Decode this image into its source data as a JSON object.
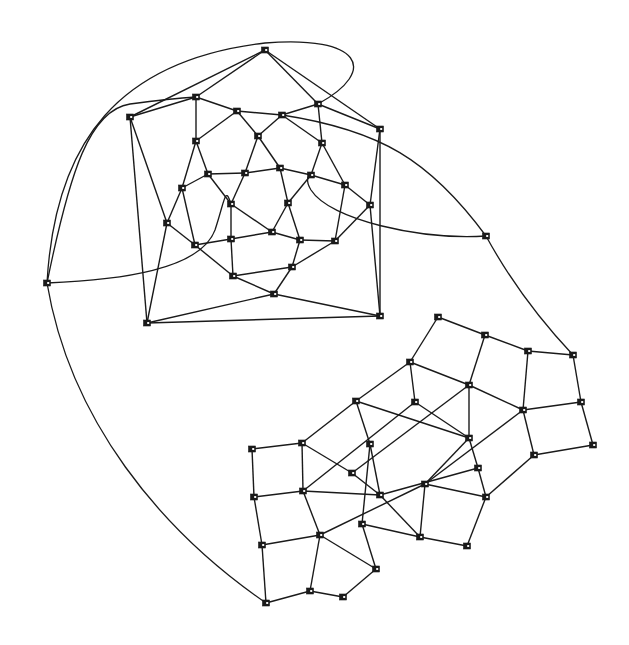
{
  "diagram": {
    "title": "",
    "colors": {
      "background": "#ffffff",
      "edge": "#1a1a1a",
      "node": "#1a1a1a"
    },
    "node_size": 7,
    "components": [
      {
        "name": "upper-component",
        "nodes": {
          "a": [
            265,
            50
          ],
          "b": [
            130,
            117
          ],
          "c": [
            196,
            97
          ],
          "d": [
            237,
            111
          ],
          "e": [
            282,
            115
          ],
          "f": [
            318,
            104
          ],
          "g": [
            380,
            129
          ],
          "h": [
            196,
            141
          ],
          "i": [
            258,
            136
          ],
          "j": [
            322,
            143
          ],
          "k": [
            208,
            174
          ],
          "l": [
            245,
            173
          ],
          "m": [
            280,
            168
          ],
          "n": [
            311,
            175
          ],
          "o": [
            345,
            185
          ],
          "p": [
            182,
            188
          ],
          "q": [
            231,
            204
          ],
          "r": [
            288,
            203
          ],
          "s": [
            370,
            205
          ],
          "t": [
            167,
            223
          ],
          "u": [
            195,
            245
          ],
          "v": [
            231,
            239
          ],
          "w": [
            272,
            232
          ],
          "x": [
            300,
            240
          ],
          "y": [
            335,
            241
          ],
          "z": [
            233,
            276
          ],
          "aa": [
            292,
            267
          ],
          "ab": [
            274,
            294
          ],
          "ac": [
            147,
            323
          ],
          "ad": [
            380,
            316
          ]
        },
        "edges": [
          [
            "a",
            "b"
          ],
          [
            "a",
            "c"
          ],
          [
            "a",
            "f"
          ],
          [
            "a",
            "g"
          ],
          [
            "b",
            "c"
          ],
          [
            "b",
            "t"
          ],
          [
            "b",
            "ac"
          ],
          [
            "c",
            "d"
          ],
          [
            "c",
            "h"
          ],
          [
            "d",
            "e"
          ],
          [
            "d",
            "h"
          ],
          [
            "d",
            "i"
          ],
          [
            "e",
            "f"
          ],
          [
            "e",
            "i"
          ],
          [
            "e",
            "j"
          ],
          [
            "f",
            "g"
          ],
          [
            "f",
            "j"
          ],
          [
            "g",
            "ad"
          ],
          [
            "g",
            "s"
          ],
          [
            "h",
            "p"
          ],
          [
            "h",
            "k"
          ],
          [
            "i",
            "l"
          ],
          [
            "i",
            "m"
          ],
          [
            "j",
            "n"
          ],
          [
            "j",
            "o"
          ],
          [
            "k",
            "l"
          ],
          [
            "k",
            "p"
          ],
          [
            "k",
            "q"
          ],
          [
            "l",
            "m"
          ],
          [
            "l",
            "q"
          ],
          [
            "m",
            "n"
          ],
          [
            "m",
            "r"
          ],
          [
            "n",
            "o"
          ],
          [
            "n",
            "r"
          ],
          [
            "o",
            "s"
          ],
          [
            "o",
            "y"
          ],
          [
            "p",
            "t"
          ],
          [
            "p",
            "u"
          ],
          [
            "q",
            "v"
          ],
          [
            "q",
            "w"
          ],
          [
            "r",
            "w"
          ],
          [
            "r",
            "x"
          ],
          [
            "s",
            "y"
          ],
          [
            "s",
            "ad"
          ],
          [
            "t",
            "u"
          ],
          [
            "t",
            "ac"
          ],
          [
            "u",
            "v"
          ],
          [
            "u",
            "z"
          ],
          [
            "v",
            "w"
          ],
          [
            "v",
            "z"
          ],
          [
            "w",
            "x"
          ],
          [
            "x",
            "y"
          ],
          [
            "x",
            "aa"
          ],
          [
            "y",
            "aa"
          ],
          [
            "z",
            "aa"
          ],
          [
            "z",
            "ab"
          ],
          [
            "aa",
            "ab"
          ],
          [
            "ab",
            "ac"
          ],
          [
            "ab",
            "ad"
          ],
          [
            "ac",
            "ad"
          ]
        ]
      },
      {
        "name": "lower-component",
        "nodes": {
          "p1": [
            438,
            317
          ],
          "p2": [
            485,
            335
          ],
          "p3": [
            528,
            351
          ],
          "p4": [
            573,
            355
          ],
          "p5": [
            410,
            362
          ],
          "p6": [
            469,
            385
          ],
          "p7": [
            523,
            410
          ],
          "p8": [
            581,
            402
          ],
          "p9": [
            356,
            401
          ],
          "p10": [
            415,
            402
          ],
          "p11": [
            469,
            438
          ],
          "p12": [
            534,
            455
          ],
          "p13": [
            593,
            445
          ],
          "p14": [
            302,
            443
          ],
          "p15": [
            370,
            444
          ],
          "p16": [
            352,
            473
          ],
          "p17": [
            425,
            484
          ],
          "p18": [
            478,
            468
          ],
          "p19": [
            486,
            497
          ],
          "p20": [
            252,
            449
          ],
          "p21": [
            303,
            491
          ],
          "p22": [
            380,
            495
          ],
          "p23": [
            262,
            545
          ],
          "p24": [
            320,
            535
          ],
          "p25": [
            362,
            524
          ],
          "p26": [
            420,
            537
          ],
          "p27": [
            467,
            546
          ],
          "p28": [
            266,
            603
          ],
          "p29": [
            310,
            591
          ],
          "p30": [
            343,
            597
          ],
          "p31": [
            376,
            569
          ],
          "p32": [
            254,
            497
          ]
        },
        "edges": [
          [
            "p1",
            "p2"
          ],
          [
            "p2",
            "p3"
          ],
          [
            "p3",
            "p4"
          ],
          [
            "p1",
            "p5"
          ],
          [
            "p2",
            "p6"
          ],
          [
            "p3",
            "p7"
          ],
          [
            "p4",
            "p8"
          ],
          [
            "p5",
            "p6"
          ],
          [
            "p6",
            "p7"
          ],
          [
            "p7",
            "p8"
          ],
          [
            "p8",
            "p13"
          ],
          [
            "p5",
            "p9"
          ],
          [
            "p5",
            "p10"
          ],
          [
            "p6",
            "p11"
          ],
          [
            "p6",
            "p16"
          ],
          [
            "p7",
            "p12"
          ],
          [
            "p7",
            "p17"
          ],
          [
            "p9",
            "p14"
          ],
          [
            "p9",
            "p15"
          ],
          [
            "p9",
            "p11"
          ],
          [
            "p10",
            "p11"
          ],
          [
            "p10",
            "p21"
          ],
          [
            "p11",
            "p17"
          ],
          [
            "p11",
            "p18"
          ],
          [
            "p12",
            "p13"
          ],
          [
            "p12",
            "p19"
          ],
          [
            "p14",
            "p20"
          ],
          [
            "p14",
            "p21"
          ],
          [
            "p14",
            "p16"
          ],
          [
            "p15",
            "p22"
          ],
          [
            "p15",
            "p25"
          ],
          [
            "p16",
            "p22"
          ],
          [
            "p17",
            "p19"
          ],
          [
            "p17",
            "p26"
          ],
          [
            "p17",
            "p24"
          ],
          [
            "p18",
            "p19"
          ],
          [
            "p18",
            "p22"
          ],
          [
            "p19",
            "p27"
          ],
          [
            "p20",
            "p32"
          ],
          [
            "p21",
            "p32"
          ],
          [
            "p21",
            "p24"
          ],
          [
            "p21",
            "p22"
          ],
          [
            "p22",
            "p26"
          ],
          [
            "p23",
            "p32"
          ],
          [
            "p23",
            "p24"
          ],
          [
            "p23",
            "p28"
          ],
          [
            "p24",
            "p29"
          ],
          [
            "p24",
            "p31"
          ],
          [
            "p25",
            "p26"
          ],
          [
            "p25",
            "p31"
          ],
          [
            "p26",
            "p27"
          ],
          [
            "p28",
            "p29"
          ],
          [
            "p29",
            "p30"
          ],
          [
            "p30",
            "p31"
          ]
        ]
      }
    ],
    "external_nodes": {
      "ext_left": [
        47,
        283
      ],
      "ext_right": [
        486,
        236
      ]
    },
    "curves": [
      {
        "name": "curve-ext-left-to-a",
        "d": "M47,283 C55,140 120,60 265,43 C360,35 380,70 318,104"
      },
      {
        "name": "curve-ext-left-to-c",
        "d": "M47,283 C70,170 90,110 130,104 C160,100 180,98 196,97"
      },
      {
        "name": "curve-ext-left-to-h",
        "d": "M47,283 C120,280 200,270 215,230 C225,200 225,185 231,204"
      },
      {
        "name": "curve-ext-right-to-e",
        "d": "M486,236 C430,160 380,130 282,115"
      },
      {
        "name": "curve-ext-right-to-n",
        "d": "M486,236 C420,240 330,220 311,190 C305,180 308,176 311,175"
      },
      {
        "name": "curve-ext-right-to-p4",
        "d": "M486,236 C510,280 540,320 573,355"
      },
      {
        "name": "curve-ext-left-to-p28",
        "d": "M47,283 C70,420 160,530 266,603"
      }
    ]
  }
}
